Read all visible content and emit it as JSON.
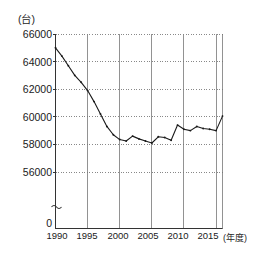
{
  "chart_data": {
    "type": "line",
    "title": "",
    "subtitle": "",
    "xlabel": "(年度)",
    "ylabel": "(台)",
    "unit_y": "(台)",
    "unit_x": "(年度)",
    "grid": true,
    "legend": "none",
    "axis_break": true,
    "axis_break_symbol": "≈",
    "ylim": [
      56000,
      66000
    ],
    "y_axis_zero_label": "0",
    "yticks": [
      66000,
      64000,
      62000,
      60000,
      58000,
      56000
    ],
    "ytick_labels": [
      "66000",
      "64000",
      "62000",
      "60000",
      "58000",
      "56000",
      "0"
    ],
    "xlim": [
      1990,
      2016
    ],
    "xticks": [
      1990,
      1995,
      2000,
      2005,
      2010,
      2015
    ],
    "xtick_labels": [
      "1990",
      "1995",
      "2000",
      "2005",
      "2010",
      "2015"
    ],
    "x": [
      1990,
      1991,
      1992,
      1993,
      1994,
      1995,
      1996,
      1997,
      1998,
      1999,
      2000,
      2001,
      2002,
      2003,
      2004,
      2005,
      2006,
      2007,
      2008,
      2009,
      2010,
      2011,
      2012,
      2013,
      2014,
      2015,
      2016
    ],
    "values": [
      65000,
      64400,
      63700,
      63000,
      62500,
      61900,
      61100,
      60200,
      59300,
      58700,
      58350,
      58250,
      58600,
      58400,
      58250,
      58100,
      58550,
      58500,
      58300,
      59400,
      59100,
      59000,
      59300,
      59150,
      59100,
      59000,
      60050
    ],
    "series": [
      {
        "name": "台数",
        "values": [
          65000,
          64400,
          63700,
          63000,
          62500,
          61900,
          61100,
          60200,
          59300,
          58700,
          58350,
          58250,
          58600,
          58400,
          58250,
          58100,
          58550,
          58500,
          58300,
          59400,
          59100,
          59000,
          59300,
          59150,
          59100,
          59000,
          60050
        ]
      }
    ],
    "line_color": "#1a1a1a",
    "marker": "dot",
    "marker_color": "#1a1a1a",
    "grid_color": "#555555",
    "axis_color": "#333333"
  }
}
